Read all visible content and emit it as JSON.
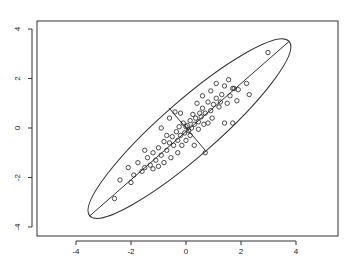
{
  "chart_data": {
    "type": "scatter",
    "title": "",
    "xlabel": "",
    "ylabel": "",
    "xlim": [
      -5.2,
      5.6
    ],
    "ylim": [
      -4.3,
      4.3
    ],
    "x_ticks": [
      -4,
      -2,
      0,
      2,
      4
    ],
    "y_ticks": [
      -4,
      -2,
      0,
      2,
      4
    ],
    "grid": false,
    "legend": null,
    "annotations": [
      "confidence ellipse with major and minor axes"
    ],
    "ellipse": {
      "center": [
        0.05,
        0.0
      ],
      "major_axis_end_upper": [
        3.75,
        3.5
      ],
      "major_axis_end_lower": [
        -3.5,
        -3.55
      ],
      "minor_axis_end_upper": [
        -0.62,
        0.81
      ],
      "minor_axis_end_lower": [
        0.69,
        -0.89
      ]
    },
    "series": [
      {
        "name": "points",
        "marker": "open-circle",
        "points": [
          [
            2.98,
            3.05
          ],
          [
            2.2,
            1.8
          ],
          [
            1.9,
            1.55
          ],
          [
            1.7,
            1.6
          ],
          [
            1.6,
            1.3
          ],
          [
            1.85,
            1.1
          ],
          [
            1.5,
            1.0
          ],
          [
            1.3,
            1.35
          ],
          [
            1.1,
            1.2
          ],
          [
            1.2,
            0.85
          ],
          [
            1.0,
            0.95
          ],
          [
            0.9,
            0.7
          ],
          [
            0.8,
            1.05
          ],
          [
            0.7,
            0.6
          ],
          [
            0.6,
            0.8
          ],
          [
            0.55,
            0.45
          ],
          [
            0.5,
            0.6
          ],
          [
            0.45,
            0.25
          ],
          [
            0.35,
            0.4
          ],
          [
            0.3,
            0.15
          ],
          [
            0.25,
            0.55
          ],
          [
            0.2,
            0.0
          ],
          [
            0.15,
            0.3
          ],
          [
            0.1,
            -0.1
          ],
          [
            0.05,
            0.1
          ],
          [
            0.0,
            0.05
          ],
          [
            -0.05,
            -0.2
          ],
          [
            -0.1,
            0.2
          ],
          [
            -0.2,
            -0.3
          ],
          [
            -0.25,
            0.05
          ],
          [
            -0.3,
            -0.5
          ],
          [
            -0.35,
            -0.15
          ],
          [
            -0.45,
            -0.7
          ],
          [
            -0.5,
            -0.35
          ],
          [
            -0.6,
            -0.6
          ],
          [
            -0.7,
            -0.9
          ],
          [
            -0.8,
            -0.55
          ],
          [
            -0.9,
            -1.1
          ],
          [
            -1.0,
            -0.8
          ],
          [
            -1.1,
            -1.3
          ],
          [
            -1.2,
            -1.0
          ],
          [
            -1.3,
            -1.5
          ],
          [
            -1.4,
            -1.2
          ],
          [
            -1.5,
            -1.6
          ],
          [
            -1.6,
            -1.75
          ],
          [
            -1.75,
            -1.4
          ],
          [
            -1.9,
            -1.9
          ],
          [
            -2.1,
            -1.6
          ],
          [
            -2.0,
            -2.2
          ],
          [
            -2.4,
            -2.1
          ],
          [
            -2.6,
            -2.85
          ],
          [
            1.4,
            0.2
          ],
          [
            1.7,
            0.2
          ],
          [
            0.8,
            0.2
          ],
          [
            0.3,
            -0.7
          ],
          [
            -0.9,
            0.0
          ],
          [
            -0.6,
            0.4
          ],
          [
            0.9,
            1.5
          ],
          [
            1.1,
            1.8
          ],
          [
            0.6,
            1.3
          ],
          [
            0.4,
            1.0
          ],
          [
            1.4,
            1.7
          ],
          [
            1.55,
            1.95
          ],
          [
            0.95,
            0.4
          ],
          [
            0.65,
            0.15
          ],
          [
            -0.3,
            -1.0
          ],
          [
            -0.55,
            -1.2
          ],
          [
            -1.5,
            -0.9
          ],
          [
            -1.2,
            -1.65
          ],
          [
            -0.4,
            0.65
          ],
          [
            0.0,
            -0.5
          ],
          [
            0.15,
            -0.3
          ],
          [
            -0.15,
            -0.7
          ],
          [
            -0.8,
            -1.4
          ],
          [
            -1.0,
            -1.55
          ],
          [
            -0.7,
            -0.3
          ],
          [
            1.25,
            1.05
          ],
          [
            1.75,
            1.6
          ],
          [
            2.3,
            1.35
          ],
          [
            0.7,
            -1.0
          ],
          [
            -0.2,
            0.6
          ],
          [
            0.45,
            -0.05
          ]
        ]
      }
    ]
  }
}
